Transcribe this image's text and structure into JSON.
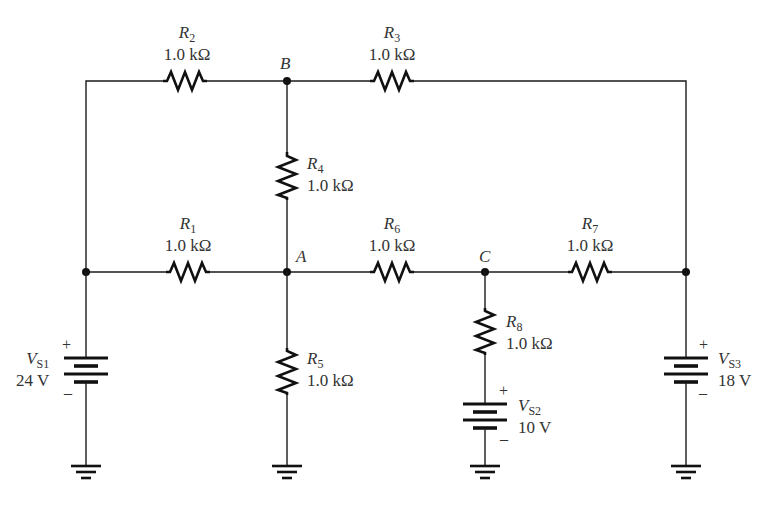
{
  "diagram": {
    "type": "circuit-schematic",
    "nodes": [
      {
        "id": "B",
        "label": "B"
      },
      {
        "id": "A",
        "label": "A"
      },
      {
        "id": "C",
        "label": "C"
      }
    ],
    "resistors": [
      {
        "id": "R1",
        "letter": "R",
        "sub": "1",
        "value": "1.0 kΩ"
      },
      {
        "id": "R2",
        "letter": "R",
        "sub": "2",
        "value": "1.0 kΩ"
      },
      {
        "id": "R3",
        "letter": "R",
        "sub": "3",
        "value": "1.0 kΩ"
      },
      {
        "id": "R4",
        "letter": "R",
        "sub": "4",
        "value": "1.0 kΩ"
      },
      {
        "id": "R5",
        "letter": "R",
        "sub": "5",
        "value": "1.0 kΩ"
      },
      {
        "id": "R6",
        "letter": "R",
        "sub": "6",
        "value": "1.0 kΩ"
      },
      {
        "id": "R7",
        "letter": "R",
        "sub": "7",
        "value": "1.0 kΩ"
      },
      {
        "id": "R8",
        "letter": "R",
        "sub": "8",
        "value": "1.0 kΩ"
      }
    ],
    "sources": [
      {
        "id": "VS1",
        "letter": "V",
        "sub": "S1",
        "value": "24 V",
        "plus": "+",
        "minus": "–"
      },
      {
        "id": "VS2",
        "letter": "V",
        "sub": "S2",
        "value": "10 V",
        "plus": "+",
        "minus": "–"
      },
      {
        "id": "VS3",
        "letter": "V",
        "sub": "S3",
        "value": "18 V",
        "plus": "+",
        "minus": "–"
      }
    ],
    "colors": {
      "line": "#111111",
      "text": "#333333",
      "background": "#ffffff"
    }
  }
}
